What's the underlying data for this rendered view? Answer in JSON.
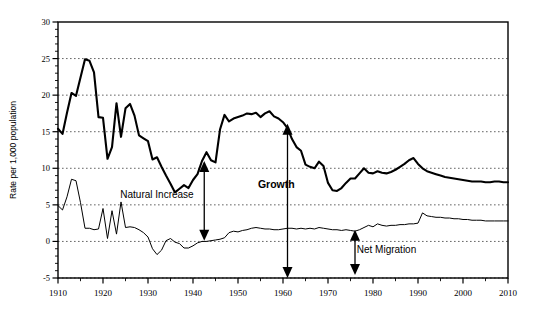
{
  "chart_data": {
    "type": "line",
    "title": "",
    "subtitle": "",
    "xlabel": "",
    "ylabel": "Rate per 1,000 population",
    "xlim": [
      1910,
      2010
    ],
    "ylim": [
      -5,
      30
    ],
    "grid": true,
    "grid_style": "dotted-horizontal",
    "legend": "none",
    "x_ticks": [
      "1910",
      "1920",
      "1930",
      "1940",
      "1950",
      "1960",
      "1970",
      "1980",
      "1990",
      "2000",
      "2010"
    ],
    "x_tick_values": [
      1910,
      1920,
      1930,
      1940,
      1950,
      1960,
      1970,
      1980,
      1990,
      2000,
      2010
    ],
    "x_minor_tick_interval": 5,
    "y_ticks": [
      "-5",
      "0",
      "5",
      "10",
      "15",
      "20",
      "25",
      "30"
    ],
    "y_tick_values": [
      -5,
      0,
      5,
      10,
      15,
      20,
      25,
      30
    ],
    "y_minor_tick_interval": 1,
    "x": [
      1910,
      1911,
      1912,
      1913,
      1914,
      1915,
      1916,
      1917,
      1918,
      1919,
      1920,
      1921,
      1922,
      1923,
      1924,
      1925,
      1926,
      1927,
      1928,
      1929,
      1930,
      1931,
      1932,
      1933,
      1934,
      1935,
      1936,
      1937,
      1938,
      1939,
      1940,
      1941,
      1942,
      1943,
      1944,
      1945,
      1946,
      1947,
      1948,
      1949,
      1950,
      1951,
      1952,
      1953,
      1954,
      1955,
      1956,
      1957,
      1958,
      1959,
      1960,
      1961,
      1962,
      1963,
      1964,
      1965,
      1966,
      1967,
      1968,
      1969,
      1970,
      1971,
      1972,
      1973,
      1974,
      1975,
      1976,
      1977,
      1978,
      1979,
      1980,
      1981,
      1982,
      1983,
      1984,
      1985,
      1986,
      1987,
      1988,
      1989,
      1990,
      1991,
      1992,
      1993,
      1994,
      1995,
      1996,
      1997,
      1998,
      1999,
      2000,
      2001,
      2002,
      2003,
      2004,
      2005,
      2006,
      2007,
      2008,
      2009,
      2010
    ],
    "series": [
      {
        "name": "Growth",
        "color": "#000000",
        "line_width": 2.1,
        "values": [
          15.4,
          14.7,
          17.6,
          20.3,
          19.9,
          22.4,
          24.9,
          24.7,
          23.1,
          17.0,
          16.9,
          11.3,
          12.9,
          18.9,
          14.3,
          18.2,
          18.8,
          17.2,
          14.5,
          14.1,
          13.7,
          11.2,
          11.5,
          10.2,
          9.0,
          7.9,
          6.7,
          7.2,
          7.7,
          7.3,
          8.4,
          9.2,
          11.0,
          12.2,
          11.1,
          10.8,
          15.3,
          17.3,
          16.4,
          16.8,
          17.0,
          17.2,
          17.5,
          17.4,
          17.6,
          17.0,
          17.5,
          17.8,
          17.1,
          16.8,
          16.3,
          15.5,
          14.0,
          12.9,
          12.4,
          10.5,
          10.2,
          10.0,
          10.9,
          10.3,
          8.0,
          7.0,
          6.9,
          7.3,
          8.0,
          8.6,
          8.6,
          9.3,
          10.0,
          9.4,
          9.3,
          9.6,
          9.4,
          9.3,
          9.5,
          9.8,
          10.2,
          10.6,
          11.1,
          11.4,
          10.6,
          10.0,
          9.6,
          9.4,
          9.2,
          9.0,
          8.8,
          8.7,
          8.6,
          8.5,
          8.4,
          8.3,
          8.2,
          8.2,
          8.2,
          8.1,
          8.1,
          8.2,
          8.2,
          8.1,
          8.1
        ]
      },
      {
        "name": "Net Migration",
        "color": "#000000",
        "line_width": 1.0,
        "values": [
          4.9,
          4.3,
          6.1,
          8.5,
          8.3,
          5.3,
          1.8,
          1.8,
          1.6,
          1.7,
          4.5,
          0.4,
          4.2,
          1.0,
          5.4,
          1.9,
          2.0,
          1.9,
          1.6,
          1.2,
          0.6,
          -1.0,
          -1.8,
          -1.2,
          0.1,
          0.4,
          -0.1,
          -0.3,
          -0.9,
          -0.9,
          -0.6,
          -0.2,
          0.0,
          0.0,
          0.1,
          0.2,
          0.3,
          0.5,
          1.2,
          1.4,
          1.3,
          1.5,
          1.6,
          1.8,
          1.9,
          1.8,
          1.7,
          1.7,
          1.6,
          1.6,
          1.7,
          1.8,
          1.8,
          1.7,
          1.8,
          1.7,
          1.8,
          1.7,
          1.9,
          1.8,
          1.7,
          1.6,
          1.6,
          1.5,
          1.6,
          1.5,
          1.4,
          1.6,
          1.9,
          2.2,
          2.0,
          2.4,
          2.2,
          2.1,
          2.2,
          2.2,
          2.3,
          2.3,
          2.4,
          2.4,
          2.5,
          3.9,
          3.5,
          3.4,
          3.3,
          3.3,
          3.2,
          3.2,
          3.1,
          3.1,
          3.0,
          3.0,
          2.9,
          2.9,
          2.9,
          2.8,
          2.8,
          2.8,
          2.8,
          2.8,
          2.8
        ]
      }
    ],
    "annotations": [
      {
        "id": "natural-increase",
        "label": "Natural Increase",
        "bold": false,
        "x_value": 1942.5,
        "arrow_type": "double-vertical",
        "arrow_top_value": 11.0,
        "arrow_bottom_value": 0.1,
        "label_x_value": 1932.0,
        "label_y_value": 6.0
      },
      {
        "id": "growth",
        "label": "Growth",
        "bold": true,
        "x_value": 1961.0,
        "arrow_type": "double-vertical",
        "arrow_top_value": 16.1,
        "arrow_bottom_value": -5.0,
        "label_x_value": 1958.5,
        "label_y_value": 7.3
      },
      {
        "id": "net-migration",
        "label": "Net Migration",
        "bold": false,
        "x_value": 1976.0,
        "arrow_type": "double-vertical",
        "arrow_top_value": 1.6,
        "arrow_bottom_value": -4.6,
        "label_x_value": 1983.0,
        "label_y_value": -1.6
      }
    ]
  },
  "axis": {
    "y_axis_title": "Rate per 1,000 population"
  },
  "colors": {
    "line": "#000000",
    "grid": "#555555",
    "axis": "#000000",
    "background": "#ffffff"
  }
}
